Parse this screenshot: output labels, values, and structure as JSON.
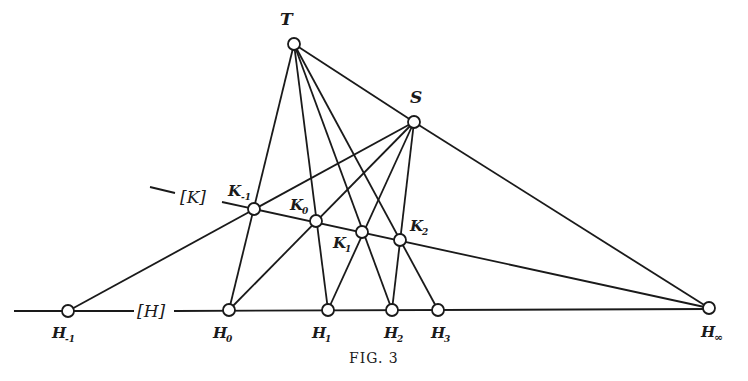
{
  "figure": {
    "caption": "Fig. 3",
    "caption_display": "FIG. 3",
    "line_labels": {
      "K": "[K]",
      "H": "[H]"
    },
    "points": {
      "T": {
        "label": "T",
        "sub": "",
        "x": 294,
        "y": 44
      },
      "S": {
        "label": "S",
        "sub": "",
        "x": 414,
        "y": 122
      },
      "Hm1": {
        "label": "H",
        "sub": "-1",
        "x": 68,
        "y": 311
      },
      "H0": {
        "label": "H",
        "sub": "0",
        "x": 229,
        "y": 310
      },
      "H1": {
        "label": "H",
        "sub": "1",
        "x": 328,
        "y": 310
      },
      "H2": {
        "label": "H",
        "sub": "2",
        "x": 392,
        "y": 310
      },
      "H3": {
        "label": "H",
        "sub": "3",
        "x": 438,
        "y": 310
      },
      "Hinf": {
        "label": "H",
        "sub": "∞",
        "x": 709,
        "y": 308
      },
      "Km1": {
        "label": "K",
        "sub": "-1",
        "x": 254,
        "y": 209
      },
      "K0": {
        "label": "K",
        "sub": "0",
        "x": 316,
        "y": 221
      },
      "K1": {
        "label": "K",
        "sub": "1",
        "x": 362,
        "y": 232
      },
      "K2": {
        "label": "K",
        "sub": "2",
        "x": 400,
        "y": 240
      }
    },
    "lines": [
      [
        "T",
        "H0"
      ],
      [
        "T",
        "H1"
      ],
      [
        "T",
        "H2"
      ],
      [
        "T",
        "H3"
      ],
      [
        "T",
        "Hinf"
      ],
      [
        "S",
        "Hm1"
      ],
      [
        "S",
        "H0"
      ],
      [
        "S",
        "H1"
      ],
      [
        "S",
        "H2"
      ],
      [
        "S",
        "Hinf"
      ],
      [
        "K",
        "Hinf"
      ],
      [
        "H",
        "axis"
      ]
    ]
  }
}
